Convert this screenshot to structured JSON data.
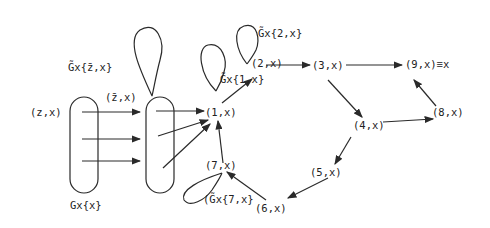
{
  "diagram": {
    "nodes": {
      "z": "(z,x)",
      "zbar": "(z̄,x)",
      "n1": "(1,x)",
      "n2": "(2,x)",
      "n3": "(3,x)",
      "n4": "(4,x)",
      "n5": "(5,x)",
      "n6": "(6,x)",
      "n7": "(7,x)",
      "n8": "(8,x)",
      "n9": "(9,x)≡x"
    },
    "labels": {
      "gx_x": "Gx{x}",
      "gx_zbar": "G̃x{z̄,x}",
      "gx_1": "G̃x{1,x}",
      "gx_2": "G̃x{2,x}",
      "gx_7": "(G̃x{7,x}"
    },
    "edges": [
      [
        "zbar-block",
        "n1"
      ],
      [
        "n1",
        "n2"
      ],
      [
        "n2",
        "n3"
      ],
      [
        "n3",
        "n9"
      ],
      [
        "n3",
        "n4"
      ],
      [
        "n4",
        "n8"
      ],
      [
        "n8",
        "n9"
      ],
      [
        "n4",
        "n5"
      ],
      [
        "n5",
        "n6"
      ],
      [
        "n6",
        "n7"
      ],
      [
        "n7",
        "n1"
      ]
    ]
  }
}
